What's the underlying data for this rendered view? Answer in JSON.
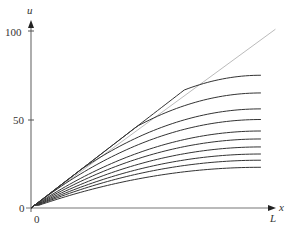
{
  "chart_data": {
    "type": "line",
    "title": "",
    "xlabel": "x",
    "ylabel": "u",
    "x_ticks": [
      "0",
      "L"
    ],
    "y_ticks": [
      "0",
      "50",
      "100"
    ],
    "xlim": [
      0,
      1
    ],
    "ylim": [
      0,
      100
    ],
    "grid": false,
    "legend": null,
    "x": [
      0,
      0.1,
      0.2,
      0.3,
      0.4,
      0.5,
      0.6,
      0.7,
      0.8,
      0.9,
      1.0
    ],
    "reference_line": {
      "name": "u = 100x/L",
      "color": "#bbbbbb",
      "values": [
        0,
        10,
        20,
        30,
        40,
        50,
        60,
        70,
        80,
        90,
        100
      ]
    },
    "series": [
      {
        "name": "curve-1",
        "end_value": 75
      },
      {
        "name": "curve-2",
        "end_value": 65
      },
      {
        "name": "curve-3",
        "end_value": 56
      },
      {
        "name": "curve-4",
        "end_value": 50
      },
      {
        "name": "curve-5",
        "end_value": 43.5
      },
      {
        "name": "curve-6",
        "end_value": 39
      },
      {
        "name": "curve-7",
        "end_value": 34.5
      },
      {
        "name": "curve-8",
        "end_value": 30.5
      },
      {
        "name": "curve-9",
        "end_value": 27
      },
      {
        "name": "curve-10",
        "end_value": 23
      }
    ],
    "curve_color": "#333333"
  },
  "labels": {
    "y_axis": "u",
    "x_axis": "x",
    "y_100": "100",
    "y_50": "50",
    "y_0": "0",
    "x_0": "0",
    "x_L": "L"
  }
}
